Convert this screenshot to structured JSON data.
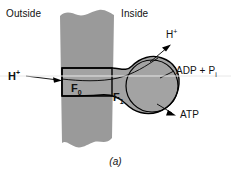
{
  "figure": {
    "caption": "(a)",
    "colors": {
      "membrane_fill": "#9a9a9a",
      "complex_fill": "#a3a3a3",
      "stroke": "#000000",
      "text": "#111111",
      "background": "#ffffff"
    }
  },
  "labels": {
    "outside": "Outside",
    "inside": "Inside",
    "hplus_left": "H",
    "hplus_left_charge": "+",
    "hplus_top": "H",
    "hplus_top_charge": "+",
    "adp": "ADP + P",
    "adp_subscript": "i",
    "atp": "ATP",
    "f0": "F",
    "f0_subscript": "0",
    "f1": "F",
    "f1_subscript": "1"
  },
  "diagram": {
    "type": "biology-schematic",
    "elements": [
      {
        "name": "membrane-band",
        "description": "vertical gray band with torn wavy top and bottom edges"
      },
      {
        "name": "f0-subunit",
        "description": "rectangular region embedded in the membrane"
      },
      {
        "name": "f1-subunit",
        "description": "large bulbous head on the inside face with internal circular subunit"
      },
      {
        "name": "proton-inflow-arrow",
        "description": "arrow from outside pointing right into F0"
      },
      {
        "name": "proton-outflow-arrow",
        "description": "arrow from F1 pointing up-right to H+"
      },
      {
        "name": "adp-leader-line",
        "description": "leader line from F1 to ADP + Pi label"
      },
      {
        "name": "atp-arrow",
        "description": "arrow from F1 pointing right to ATP"
      }
    ]
  }
}
